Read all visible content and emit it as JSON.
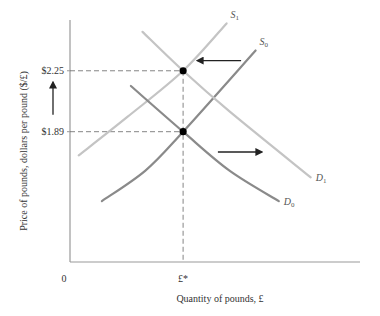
{
  "chart_data": {
    "type": "line",
    "title": "",
    "xlabel": "Quantity of pounds, £",
    "ylabel": "Price of pounds, dollars per pound ($/£)",
    "origin_label": "0",
    "x_ticks": [
      {
        "label": "£*",
        "value": 0.39
      }
    ],
    "y_ticks": [
      {
        "label": "$2.25",
        "value": 2.25
      },
      {
        "label": "$1.89",
        "value": 1.89
      }
    ],
    "xlim": [
      0,
      1
    ],
    "ylim": [
      1.12,
      2.55
    ],
    "grid": false,
    "colors": {
      "light_curve": "#c4c4c4",
      "dark_curve": "#8a8a8a",
      "axis": "#999999",
      "arrow": "#222222",
      "point": "#000000",
      "guide": "#666666"
    },
    "series": [
      {
        "name": "S1",
        "label_main": "S",
        "label_sub": "1",
        "style": "light",
        "points": [
          [
            0.03,
            1.75
          ],
          [
            0.2,
            1.98
          ],
          [
            0.39,
            2.25
          ],
          [
            0.54,
            2.53
          ]
        ]
      },
      {
        "name": "S0",
        "label_main": "S",
        "label_sub": "0",
        "style": "dark",
        "points": [
          [
            0.11,
            1.48
          ],
          [
            0.26,
            1.66
          ],
          [
            0.39,
            1.89
          ],
          [
            0.64,
            2.37
          ]
        ]
      },
      {
        "name": "D1",
        "label_main": "D",
        "label_sub": "1",
        "style": "light",
        "points": [
          [
            0.25,
            2.48
          ],
          [
            0.39,
            2.25
          ],
          [
            0.55,
            2.01
          ],
          [
            0.83,
            1.62
          ]
        ]
      },
      {
        "name": "D0",
        "label_main": "D",
        "label_sub": "0",
        "style": "dark",
        "points": [
          [
            0.21,
            2.16
          ],
          [
            0.39,
            1.89
          ],
          [
            0.55,
            1.66
          ],
          [
            0.72,
            1.48
          ]
        ]
      }
    ],
    "equilibria": [
      {
        "x": 0.39,
        "y": 2.25
      },
      {
        "x": 0.39,
        "y": 1.89
      }
    ],
    "arrows": [
      {
        "name": "supply-shift-arrow",
        "direction": "left",
        "from": [
          0.59,
          2.31
        ],
        "to": [
          0.44,
          2.31
        ]
      },
      {
        "name": "demand-shift-arrow",
        "direction": "right",
        "from": [
          0.51,
          1.77
        ],
        "to": [
          0.66,
          1.77
        ]
      },
      {
        "name": "price-rise-arrow",
        "direction": "up",
        "axis_x_offset": -17,
        "from_y": 1.99,
        "to_y": 2.18
      }
    ]
  }
}
